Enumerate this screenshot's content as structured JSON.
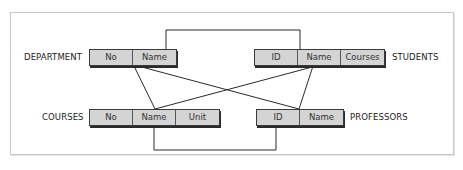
{
  "tables": {
    "department": {
      "label": "DEPARTMENT",
      "fields": [
        "No",
        "Name"
      ]
    },
    "students": {
      "label": "STUDENTS",
      "fields": [
        "ID",
        "Name",
        "Courses"
      ]
    },
    "courses": {
      "label": "COURSES",
      "fields": [
        "No",
        "Name",
        "Unit"
      ]
    },
    "professors": {
      "label": "PROFESSORS",
      "fields": [
        "ID",
        "Name"
      ]
    }
  },
  "colors": {
    "line": "#2a2a2a",
    "cell_fill": "#d4d4d4",
    "frame": "#c8c8c8"
  }
}
